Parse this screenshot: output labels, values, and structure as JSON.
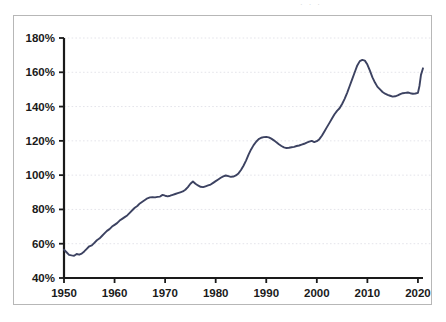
{
  "page": {
    "top_edge_remnant": "· · ·"
  },
  "chart_data": {
    "type": "line",
    "title": "",
    "subtitle": "",
    "xlabel": "",
    "ylabel": "",
    "xlim": [
      1950,
      2021
    ],
    "ylim": [
      40,
      180
    ],
    "grid": true,
    "grid_axis": "y",
    "legend": "none",
    "line_color": "#3c4261",
    "y_tick_labels": [
      "180%",
      "160%",
      "140%",
      "120%",
      "100%",
      "80%",
      "60%",
      "40%"
    ],
    "y_ticks": [
      180,
      160,
      140,
      120,
      100,
      80,
      60,
      40
    ],
    "x_tick_labels": [
      "1950",
      "1960",
      "1970",
      "1980",
      "1990",
      "2000",
      "2010",
      "2020"
    ],
    "x_ticks": [
      1950,
      1960,
      1970,
      1980,
      1990,
      2000,
      2010,
      2020
    ],
    "series": [
      {
        "name": "Debt as percent of GDP",
        "x": [
          1950,
          1950.5,
          1951,
          1951.5,
          1952,
          1952.5,
          1953,
          1953.5,
          1954,
          1954.5,
          1955,
          1955.5,
          1956,
          1956.5,
          1957,
          1957.5,
          1958,
          1958.5,
          1959,
          1959.5,
          1960,
          1960.5,
          1961,
          1961.5,
          1962,
          1962.5,
          1963,
          1963.5,
          1964,
          1964.5,
          1965,
          1965.5,
          1966,
          1966.5,
          1967,
          1967.5,
          1968,
          1968.5,
          1969,
          1969.5,
          1970,
          1970.5,
          1971,
          1971.5,
          1972,
          1972.5,
          1973,
          1973.5,
          1974,
          1974.5,
          1975,
          1975.5,
          1976,
          1976.5,
          1977,
          1977.5,
          1978,
          1978.5,
          1979,
          1979.5,
          1980,
          1980.5,
          1981,
          1981.5,
          1982,
          1982.5,
          1983,
          1983.5,
          1984,
          1984.5,
          1985,
          1985.5,
          1986,
          1986.5,
          1987,
          1987.5,
          1988,
          1988.5,
          1989,
          1989.5,
          1990,
          1990.5,
          1991,
          1991.5,
          1992,
          1992.5,
          1993,
          1993.5,
          1994,
          1994.5,
          1995,
          1995.5,
          1996,
          1996.5,
          1997,
          1997.5,
          1998,
          1998.5,
          1999,
          1999.5,
          2000,
          2000.5,
          2001,
          2001.5,
          2002,
          2002.5,
          2003,
          2003.5,
          2004,
          2004.5,
          2005,
          2005.5,
          2006,
          2006.5,
          2007,
          2007.5,
          2008,
          2008.5,
          2009,
          2009.5,
          2010,
          2010.5,
          2011,
          2011.5,
          2012,
          2012.5,
          2013,
          2013.5,
          2014,
          2014.5,
          2015,
          2015.5,
          2016,
          2016.5,
          2017,
          2017.5,
          2018,
          2018.5,
          2019,
          2019.5,
          2020,
          2020.3,
          2020.6,
          2021
        ],
        "y": [
          56.5,
          55.0,
          53.5,
          53.2,
          53.0,
          54.0,
          53.6,
          54.2,
          55.5,
          57.0,
          58.5,
          59.0,
          60.5,
          62.0,
          63.0,
          64.5,
          66.0,
          67.5,
          68.5,
          70.0,
          71.0,
          72.0,
          73.5,
          74.5,
          75.5,
          76.5,
          78.0,
          79.5,
          81.0,
          82.0,
          83.5,
          84.5,
          85.5,
          86.5,
          87.0,
          87.2,
          87.0,
          87.3,
          87.5,
          88.5,
          88.0,
          87.6,
          88.0,
          88.5,
          89.0,
          89.5,
          90.0,
          90.5,
          91.5,
          93.0,
          95.0,
          96.3,
          95.0,
          94.0,
          93.2,
          93.0,
          93.5,
          94.0,
          94.5,
          95.5,
          96.5,
          97.5,
          98.5,
          99.3,
          99.8,
          99.4,
          99.0,
          99.2,
          99.8,
          101.0,
          103.0,
          105.5,
          108.5,
          112.0,
          115.0,
          117.5,
          119.5,
          121.0,
          121.8,
          122.2,
          122.3,
          122.0,
          121.3,
          120.3,
          119.2,
          118.0,
          117.0,
          116.2,
          115.8,
          116.0,
          116.3,
          116.5,
          117.0,
          117.3,
          117.8,
          118.3,
          119.0,
          119.5,
          120.0,
          119.3,
          119.8,
          121.0,
          123.0,
          125.5,
          128.0,
          130.5,
          133.0,
          135.5,
          137.5,
          139.0,
          141.5,
          144.5,
          148.0,
          152.0,
          156.0,
          160.0,
          164.0,
          166.5,
          167.2,
          166.8,
          164.5,
          161.0,
          157.0,
          154.0,
          151.5,
          150.0,
          148.5,
          147.5,
          146.8,
          146.3,
          145.8,
          146.0,
          146.5,
          147.3,
          147.8,
          148.0,
          148.2,
          147.8,
          147.5,
          147.6,
          148.0,
          152.0,
          158.5,
          162.3
        ]
      }
    ]
  }
}
